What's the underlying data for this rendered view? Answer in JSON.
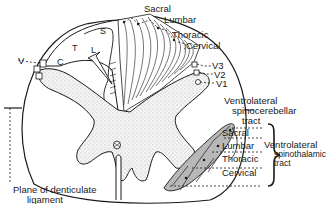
{
  "diagram": {
    "colors": {
      "line": "#1a1a1a",
      "gray_matter": "#e8e8e8",
      "tract_fill": "#bdbdbd",
      "background": "#ffffff"
    },
    "top_labels": {
      "sacral": "Sacral",
      "lumbar": "Lumbar",
      "thoracic": "Thoracic",
      "cervical": "Cervical"
    },
    "inner_labels": {
      "s": "S",
      "l": "L",
      "t": "T",
      "c": "C"
    },
    "left_labels": {
      "v": "V"
    },
    "right_v_labels": {
      "v3": "V3",
      "v2": "V2",
      "v1": "V1"
    },
    "spinocerebellar": {
      "line1": "Ventrolateral",
      "line2": "spinocerebellar",
      "line3": "tract"
    },
    "spinothalamic_segments": {
      "sacral": "Sacral",
      "lumbar": "Lumbar",
      "thoracic": "Thoracic",
      "cervical": "Cervical"
    },
    "spinothalamic": {
      "line1": "Ventrolateral",
      "line2": "spinothalamic",
      "line3": "tract"
    },
    "plane": {
      "line1": "Plane of denticulate",
      "line2": "ligament"
    }
  }
}
